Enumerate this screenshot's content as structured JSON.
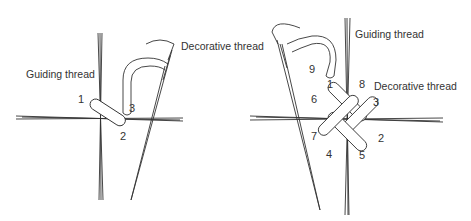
{
  "left_panel": {
    "labels": {
      "guiding_thread": "Guiding thread",
      "decorative_thread": "Decorative thread"
    },
    "step_numbers": [
      "1",
      "2",
      "3"
    ]
  },
  "right_panel": {
    "labels": {
      "guiding_thread": "Guiding thread",
      "decorative_thread": "Decorative thread"
    },
    "step_numbers": [
      "1",
      "2",
      "3",
      "4",
      "5",
      "6",
      "7",
      "8",
      "9"
    ]
  },
  "colors": {
    "line": "#333333",
    "background": "#ffffff"
  }
}
